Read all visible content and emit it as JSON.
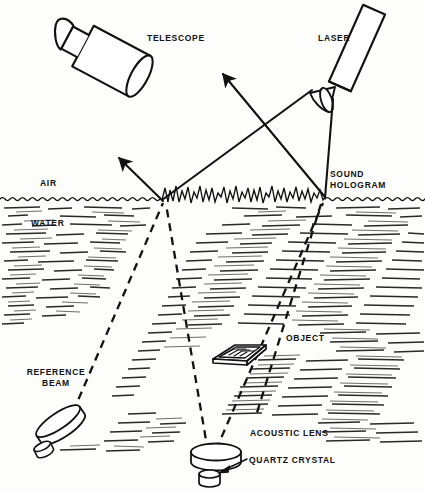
{
  "figure": {
    "domain": "diagram",
    "kind": "acoustic-holography-schematic",
    "background_color": "#fdfdfc",
    "ink_color": "#111111"
  },
  "labels": {
    "telescope": "TELESCOPE",
    "laser": "LASER",
    "air": "AIR",
    "water": "WATER",
    "sound_hologram": "SOUND\nHOLOGRAM",
    "reference_beam": "REFERENCE\nBEAM",
    "object": "OBJECT",
    "acoustic_lens": "ACOUSTIC LENS",
    "quartz_crystal": "QUARTZ CRYSTAL"
  },
  "label_positions": {
    "telescope": {
      "x": 147,
      "y": 33,
      "align": "left"
    },
    "laser": {
      "x": 318,
      "y": 33,
      "align": "left"
    },
    "air": {
      "x": 40,
      "y": 178,
      "align": "left"
    },
    "water": {
      "x": 31,
      "y": 218,
      "align": "left"
    },
    "sound_hologram": {
      "x": 330,
      "y": 171,
      "align": "left"
    },
    "reference_beam": {
      "x": 54,
      "y": 369,
      "align": "center"
    },
    "object": {
      "x": 286,
      "y": 336,
      "align": "left"
    },
    "acoustic_lens": {
      "x": 250,
      "y": 432,
      "align": "left"
    },
    "quartz_crystal": {
      "x": 249,
      "y": 462,
      "align": "left"
    }
  },
  "components": {
    "telescope": {
      "name": "telescope",
      "description": "tilted cylindrical telescope body with small eyepiece tube",
      "body_angle_deg": -62
    },
    "laser": {
      "name": "laser",
      "description": "tilted rectangular laser tube with beam expander lens at output",
      "body_angle_deg": -66
    },
    "beam_expander_lens": {
      "name": "beam-expander-lens",
      "description": "lens ellipse at laser output"
    },
    "water_surface": {
      "name": "water-surface",
      "y": 200,
      "description": "air-water interface line with small ripples"
    },
    "sound_hologram_ripples": {
      "name": "sound-hologram-ripples",
      "x_start": 162,
      "x_end": 325,
      "description": "high-amplitude standing-wave ripple pattern on the water surface"
    },
    "object": {
      "name": "object",
      "description": "flat rectangular plate target submerged in water",
      "x": 228,
      "y": 355
    },
    "acoustic_lens": {
      "name": "acoustic-lens",
      "description": "disc-shaped acoustic lens above the quartz crystal",
      "x": 216,
      "y": 456
    },
    "quartz_crystal": {
      "name": "quartz-crystal",
      "description": "small cylindrical quartz transducer crystal",
      "x": 212,
      "y": 478
    },
    "reference_transducer": {
      "name": "reference-beam-transducer",
      "description": "tilted disc transducer emitting the acoustic reference beam",
      "x": 62,
      "y": 428
    }
  },
  "rays": {
    "laser_incident": {
      "name": "laser-incident-beam",
      "style": "solid",
      "from": [
        330,
        97
      ],
      "to": [
        325,
        198
      ]
    },
    "laser_cone_edge": {
      "name": "laser-cone-edge",
      "style": "solid",
      "from": [
        306,
        92
      ],
      "to": [
        162,
        200
      ]
    },
    "reflected_beam_left": {
      "name": "reflected-beam-to-telescope",
      "style": "solid-arrow",
      "from": [
        162,
        200
      ],
      "to": [
        118,
        156
      ]
    },
    "diffracted_beam_right": {
      "name": "diffracted-beam-arrow",
      "style": "solid-arrow",
      "from": [
        325,
        198
      ],
      "to": [
        221,
        72
      ]
    },
    "reference_beam_path": {
      "name": "reference-beam-path",
      "style": "dashed",
      "from": [
        72,
        414
      ],
      "to": [
        163,
        202
      ]
    },
    "object_beam_path": {
      "name": "object-beam-path",
      "style": "dashed",
      "from": [
        211,
        455
      ],
      "to": [
        166,
        203
      ]
    },
    "object_beam_path_right": {
      "name": "object-beam-through-object",
      "style": "dashed",
      "from": [
        215,
        452
      ],
      "to": [
        323,
        202
      ]
    },
    "scattered_beam": {
      "name": "scattered-object-beam",
      "style": "dashed",
      "from": [
        322,
        203
      ],
      "to": [
        256,
        418
      ]
    }
  }
}
